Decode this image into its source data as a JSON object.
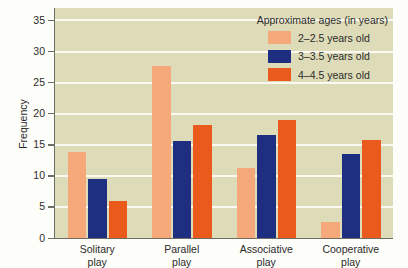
{
  "chart_data": {
    "type": "bar",
    "title": "",
    "xlabel": "",
    "ylabel": "Frequency",
    "ylim": [
      0,
      37
    ],
    "yticks": [
      0,
      5,
      10,
      15,
      20,
      25,
      30,
      35
    ],
    "grid": true,
    "legend_position": "top-right",
    "legend_title": "Approximate ages (in years)",
    "categories": [
      "Solitary play",
      "Parallel play",
      "Associative play",
      "Cooperative play"
    ],
    "category_lines": [
      [
        "Solitary",
        "play"
      ],
      [
        "Parallel",
        "play"
      ],
      [
        "Associative",
        "play"
      ],
      [
        "Cooperative",
        "play"
      ]
    ],
    "series": [
      {
        "name": "2–2.5 years old",
        "color": "#f5a97a",
        "values": [
          13.8,
          27.7,
          11.3,
          2.5
        ]
      },
      {
        "name": "3–3.5 years old",
        "color": "#1e2f81",
        "values": [
          9.5,
          15.6,
          16.5,
          13.5
        ]
      },
      {
        "name": "4–4.5 years old",
        "color": "#ea5a1d",
        "values": [
          6.0,
          18.2,
          19.0,
          15.7
        ]
      }
    ]
  },
  "colors": {
    "plot_background": "#dedcb8",
    "gridline": "#fbfaf2",
    "axis": "#6d6d63",
    "text": "#2b2b2b",
    "series_1": "#f5a97a",
    "series_2": "#1e2f81",
    "series_3": "#ea5a1d"
  }
}
